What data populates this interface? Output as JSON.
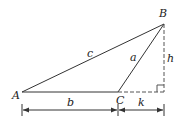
{
  "diagram": {
    "type": "triangle-with-altitude",
    "vertices": {
      "A": {
        "label": "A",
        "x": 22,
        "y": 92
      },
      "B": {
        "label": "B",
        "x": 164,
        "y": 24
      },
      "C": {
        "label": "C",
        "x": 118,
        "y": 92
      }
    },
    "foot": {
      "x": 164,
      "y": 92
    },
    "sides": {
      "c": {
        "label": "c",
        "from": "A",
        "to": "B"
      },
      "a": {
        "label": "a",
        "from": "C",
        "to": "B"
      },
      "b": {
        "label": "b",
        "from": "A",
        "to": "C"
      }
    },
    "altitude": {
      "label": "h",
      "style": "dashed"
    },
    "extension": {
      "label": "k",
      "style": "dashed"
    },
    "dimensions": [
      {
        "label": "b",
        "from_x": 22,
        "to_x": 118,
        "y": 110
      },
      {
        "label": "k",
        "from_x": 118,
        "to_x": 164,
        "y": 110
      }
    ],
    "colors": {
      "stroke": "#333333",
      "dashed": "#555555"
    }
  }
}
